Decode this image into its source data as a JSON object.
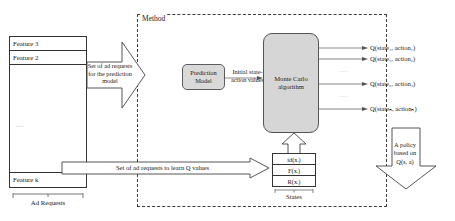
{
  "diagram": {
    "method_label": "Method",
    "colors": {
      "box_fill": "#d6d6d6",
      "stroke": "#333333",
      "dashed_stroke": "#3a3a3a",
      "background": "#ffffff"
    }
  },
  "feature_table": {
    "rows_top": [
      "Feature 3",
      "Feature 2"
    ],
    "vertical_ellipsis": "...",
    "row_bottom": "Feature k",
    "bracket_label": "Ad Requests"
  },
  "arrows": {
    "prediction_arrow_text": "Set of ad requests for the prediction model",
    "learn_arrow_text": "Set of ad requests to learn Q values",
    "initial_values_text": "Initial state-action values"
  },
  "blocks": {
    "prediction_model": "Prediction Model",
    "monte_carlo": "Monte Carlo algorithm"
  },
  "states": {
    "label": "States",
    "cells": [
      "id(xᵢ)",
      "F(xᵢ)",
      "R(xᵢ)"
    ]
  },
  "outputs": {
    "q_values": [
      "Q(state₁, action₁)",
      "Q(state₁, action₂)",
      "Q(state₂, action₃)",
      "Q(stateₙ, actionₙ)"
    ],
    "ellipsis": "···"
  },
  "policy": {
    "line1": "A policy",
    "line2": "based on",
    "line3": "Q(s, a)"
  }
}
